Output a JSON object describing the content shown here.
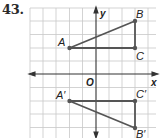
{
  "problem": {
    "number": "43."
  },
  "graph": {
    "origin_label": "O",
    "x_axis_label": "x",
    "y_axis_label": "y",
    "grid": {
      "x_range": [
        -5,
        4
      ],
      "y_range": [
        -5,
        5
      ],
      "unit": 1
    },
    "colors": {
      "grid": "#c8c8c8",
      "axes": "#333333",
      "figure": "#555555"
    },
    "original": {
      "points": [
        {
          "label": "A",
          "x": -2,
          "y": 2
        },
        {
          "label": "B",
          "x": 3,
          "y": 4
        },
        {
          "label": "C",
          "x": 3,
          "y": 2
        }
      ]
    },
    "image": {
      "points": [
        {
          "label": "A′",
          "x": -2,
          "y": -2
        },
        {
          "label": "B′",
          "x": 3,
          "y": -4
        },
        {
          "label": "C′",
          "x": 3,
          "y": -2
        }
      ]
    },
    "transformation": "reflection across x-axis"
  }
}
